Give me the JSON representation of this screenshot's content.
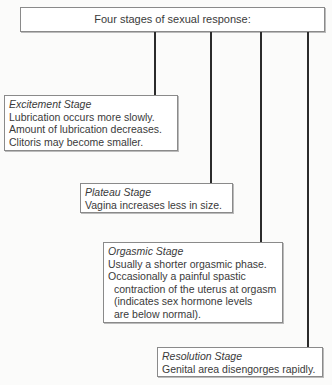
{
  "title": "Four stages of sexual response:",
  "stages": [
    {
      "name": "Excitement Stage",
      "lines": [
        "Lubrication occurs more slowly.",
        "Amount of lubrication decreases.",
        "Clitoris may become smaller."
      ]
    },
    {
      "name": "Plateau Stage",
      "lines": [
        "Vagina increases less in size."
      ]
    },
    {
      "name": "Orgasmic Stage",
      "lines": [
        "Usually a shorter orgasmic phase.",
        "Occasionally a painful spastic",
        "contraction of the uterus at orgasm",
        "(indicates sex hormone levels",
        "are below normal)."
      ]
    },
    {
      "name": "Resolution Stage",
      "lines": [
        "Genital area disengorges rapidly."
      ]
    }
  ]
}
